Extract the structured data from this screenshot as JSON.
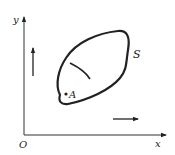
{
  "diagram": {
    "axes": {
      "x_label": "x",
      "y_label": "y",
      "origin_label": "O"
    },
    "region": {
      "label": "S",
      "point_label": "A"
    },
    "arrows": [
      {
        "name": "up-arrow",
        "direction": "up"
      },
      {
        "name": "right-arrow",
        "direction": "right"
      }
    ],
    "colors": {
      "stroke": "#222222",
      "background": "#ffffff"
    }
  }
}
